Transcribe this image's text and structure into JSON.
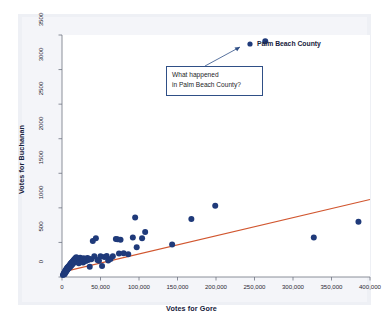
{
  "chart_data": {
    "type": "scatter",
    "title": "",
    "xlabel": "Votes for Gore",
    "ylabel": "Votes for Buchanan",
    "xlim": [
      0,
      400000
    ],
    "ylim": [
      0,
      3500
    ],
    "grid": false,
    "legend": "none",
    "xticks": [
      0,
      50000,
      100000,
      150000,
      200000,
      250000,
      300000,
      350000,
      400000
    ],
    "xticklabels": [
      "0",
      "50,000",
      "100,000",
      "150,000",
      "200,000",
      "250,000",
      "300,000",
      "350,000",
      "400,000"
    ],
    "yticks": [
      0,
      500,
      1000,
      1500,
      2000,
      2500,
      3000,
      3500
    ],
    "yticklabels": [
      "0",
      "500",
      "1000",
      "1500",
      "2000",
      "2500",
      "3000",
      "3500"
    ],
    "marker_color": "#1f3a7a",
    "marker_size": 3.0,
    "trendline": {
      "name": "least-squares regression line",
      "color": "#d1562f",
      "x": [
        0,
        400000
      ],
      "y": [
        70,
        1120
      ]
    },
    "series": [
      {
        "name": "Florida counties",
        "color": "#1f3a7a",
        "points": [
          [
            1200,
            30
          ],
          [
            2100,
            45
          ],
          [
            2600,
            55
          ],
          [
            3000,
            60
          ],
          [
            3400,
            40
          ],
          [
            3800,
            75
          ],
          [
            4200,
            90
          ],
          [
            4600,
            65
          ],
          [
            5000,
            100
          ],
          [
            5400,
            80
          ],
          [
            5800,
            115
          ],
          [
            6200,
            95
          ],
          [
            6600,
            130
          ],
          [
            7000,
            105
          ],
          [
            7400,
            140
          ],
          [
            7800,
            120
          ],
          [
            8200,
            150
          ],
          [
            8600,
            125
          ],
          [
            9000,
            160
          ],
          [
            9400,
            135
          ],
          [
            9800,
            170
          ],
          [
            10200,
            145
          ],
          [
            10600,
            185
          ],
          [
            11000,
            155
          ],
          [
            11400,
            195
          ],
          [
            11800,
            165
          ],
          [
            12200,
            205
          ],
          [
            12600,
            175
          ],
          [
            13000,
            215
          ],
          [
            13400,
            185
          ],
          [
            13800,
            225
          ],
          [
            14200,
            195
          ],
          [
            14600,
            235
          ],
          [
            15000,
            205
          ],
          [
            15400,
            245
          ],
          [
            15800,
            215
          ],
          [
            16200,
            255
          ],
          [
            16600,
            225
          ],
          [
            17000,
            265
          ],
          [
            17400,
            235
          ],
          [
            17800,
            275
          ],
          [
            18200,
            245
          ],
          [
            18600,
            285
          ],
          [
            19000,
            255
          ],
          [
            19400,
            230
          ],
          [
            20000,
            265
          ],
          [
            20600,
            215
          ],
          [
            21200,
            245
          ],
          [
            21800,
            200
          ],
          [
            22400,
            260
          ],
          [
            23000,
            225
          ],
          [
            23600,
            280
          ],
          [
            24200,
            240
          ],
          [
            25000,
            265
          ],
          [
            25800,
            235
          ],
          [
            26600,
            255
          ],
          [
            27400,
            210
          ],
          [
            28200,
            270
          ],
          [
            29000,
            240
          ],
          [
            30000,
            260
          ],
          [
            31000,
            230
          ],
          [
            32000,
            250
          ],
          [
            33000,
            275
          ],
          [
            34000,
            245
          ],
          [
            35000,
            265
          ],
          [
            36000,
            150
          ],
          [
            38000,
            255
          ],
          [
            40000,
            520
          ],
          [
            42000,
            300
          ],
          [
            44000,
            560
          ],
          [
            46000,
            245
          ],
          [
            48000,
            235
          ],
          [
            50000,
            300
          ],
          [
            52000,
            160
          ],
          [
            55000,
            290
          ],
          [
            58000,
            305
          ],
          [
            60000,
            240
          ],
          [
            63000,
            260
          ],
          [
            66000,
            300
          ],
          [
            70000,
            550
          ],
          [
            72000,
            545
          ],
          [
            74000,
            340
          ],
          [
            76000,
            540
          ],
          [
            80000,
            345
          ],
          [
            86000,
            330
          ],
          [
            92000,
            570
          ],
          [
            95000,
            860
          ],
          [
            97000,
            430
          ],
          [
            104000,
            560
          ],
          [
            108000,
            650
          ],
          [
            143000,
            470
          ],
          [
            168000,
            840
          ],
          [
            199000,
            1030
          ],
          [
            264000,
            3410
          ],
          [
            327000,
            570
          ],
          [
            385000,
            800
          ]
        ]
      }
    ],
    "annotations": [
      {
        "name": "palm-beach-county-label",
        "text": "Palm Beach County",
        "style": "bold-label-with-marker"
      },
      {
        "name": "callout-box",
        "lines": [
          "What happened",
          "in Palm Beach County?"
        ],
        "border_color": "#2f4f86",
        "points_to": "Palm Beach County"
      }
    ]
  }
}
